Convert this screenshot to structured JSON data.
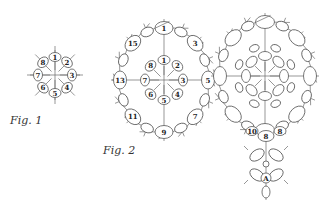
{
  "figures": [
    {
      "id": "fig1",
      "caption": "Fig. 1",
      "rings": [
        {
          "labels": [
            "1",
            "2",
            "3",
            "4",
            "5",
            "6",
            "7",
            "8"
          ]
        }
      ]
    },
    {
      "id": "fig2",
      "caption": "Fig. 2",
      "rings": [
        {
          "labels": [
            "1",
            "2",
            "3",
            "4",
            "5",
            "6",
            "7",
            "8"
          ]
        },
        {
          "labels": [
            "1",
            "3",
            "5",
            "7",
            "9",
            "11",
            "13",
            "15"
          ]
        }
      ]
    },
    {
      "id": "fig3",
      "caption": "",
      "pendant_labels": [
        "10",
        "8",
        "8",
        "A"
      ]
    }
  ],
  "colors": {
    "line": "#6a6a6a",
    "text": "#222222",
    "background": "#ffffff"
  }
}
